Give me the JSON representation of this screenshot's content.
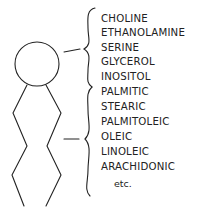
{
  "diagram": {
    "head_group_label": "Polar head group",
    "head_substituents": [
      "CHOLINE",
      "ETHANOLAMINE",
      "SERINE",
      "GLYCEROL",
      "INOSITOL"
    ],
    "fatty_acids": [
      "PALMITIC",
      "STEARIC",
      "PALMITOLEIC",
      "OLEIC",
      "LINOLEIC",
      "ARACHIDONIC"
    ],
    "etc_label": "etc.",
    "stroke_color": "#222222"
  }
}
